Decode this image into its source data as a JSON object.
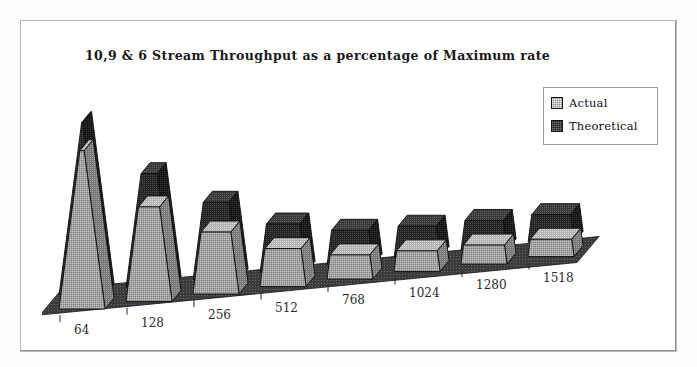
{
  "chart_data": {
    "type": "bar",
    "title": "10,9 & 6 Stream Throughput as a percentage of Maximum rate",
    "subtitle": "",
    "xlabel": "",
    "ylabel": "",
    "categories": [
      "64",
      "128",
      "256",
      "512",
      "768",
      "1024",
      "1280",
      "1518"
    ],
    "ylim": [
      0,
      100
    ],
    "grid": false,
    "legend_position": "top-right",
    "style": "3d-cone",
    "series": [
      {
        "name": "Theoretical",
        "color": "#232323",
        "values": [
          100,
          66,
          45,
          28,
          20,
          18,
          17,
          16
        ]
      },
      {
        "name": "Actual",
        "color": "#9a9a9a",
        "values": [
          92,
          55,
          36,
          22,
          14,
          12,
          11,
          10
        ]
      }
    ]
  },
  "legend": {
    "items": [
      {
        "label": "Actual",
        "swatch": "actual-swatch"
      },
      {
        "label": "Theoretical",
        "swatch": "theoretical-swatch"
      }
    ]
  },
  "axis": {
    "tick_labels": [
      "64",
      "128",
      "256",
      "512",
      "768",
      "1024",
      "1280",
      "1518"
    ]
  }
}
